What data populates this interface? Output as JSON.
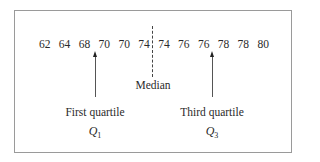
{
  "diagram": {
    "values": [
      "62",
      "64",
      "68",
      "70",
      "70",
      "74",
      "74",
      "76",
      "76",
      "78",
      "78",
      "80"
    ],
    "median_label": "Median",
    "q1": {
      "label": "First quartile",
      "symbol": "Q",
      "subscript": "1"
    },
    "q3": {
      "label": "Third quartile",
      "symbol": "Q",
      "subscript": "3"
    }
  }
}
